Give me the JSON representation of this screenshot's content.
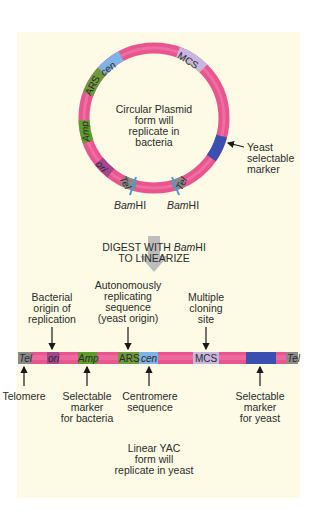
{
  "colors": {
    "background": "#ffffff",
    "panel": "#fdfbe6",
    "plasmid": "#e8558f",
    "plasmid_light": "#f27fae",
    "ars": "#6e9a3c",
    "cen": "#7fb2e6",
    "amp": "#5e9c2c",
    "ori": "#a3468e",
    "tel": "#8a8a8a",
    "mcs": "#c8b6de",
    "yeast_marker": "#3a4fb0",
    "bamhi": "#4f97d6",
    "arrow_gray": "#bdbdbd"
  },
  "circular": {
    "caption": [
      "Circular Plasmid",
      "form will",
      "replicate in",
      "bacteria"
    ],
    "segments": {
      "mcs": "MCS",
      "cen": "cen",
      "ars": "ARS",
      "amp": "Amp",
      "ori": "ori",
      "tel_left": "Tel",
      "tel_right": "Tel"
    },
    "bamhi_left": {
      "italic": "Bam",
      "plain": "HI"
    },
    "bamhi_right": {
      "italic": "Bam",
      "plain": "HI"
    },
    "yeast_marker_label": [
      "Yeast",
      "selectable",
      "marker"
    ]
  },
  "digest": {
    "line1_plain": "DIGEST WITH ",
    "line1_italic": "Bam",
    "line1_end": "HI",
    "line2": "TO LINEARIZE"
  },
  "linear": {
    "segments": {
      "tel_left": "Tel",
      "ori": "ori",
      "amp": "Amp",
      "ars": "ARS",
      "cen": "cen",
      "mcs": "MCS",
      "tel_right": "Tel"
    },
    "labels_above": {
      "ori": [
        "Bacterial",
        "origin of",
        "replication"
      ],
      "ars": [
        "Autonomously",
        "replicating",
        "sequence",
        "(yeast origin)"
      ],
      "mcs": [
        "Multiple",
        "cloning",
        "site"
      ]
    },
    "labels_below": {
      "telomere": [
        "Telomere"
      ],
      "amp": [
        "Selectable",
        "marker",
        "for bacteria"
      ],
      "cen": [
        "Centromere",
        "sequence"
      ],
      "yeast_marker": [
        "Selectable",
        "marker",
        "for yeast"
      ]
    },
    "caption": [
      "Linear YAC",
      "form will",
      "replicate in yeast"
    ]
  }
}
